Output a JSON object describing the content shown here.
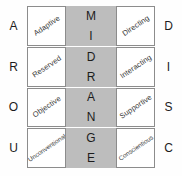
{
  "diagram": {
    "type": "personality-assessment-grid",
    "center_band": {
      "label": "MIDRANGE",
      "letters": [
        "M",
        "I",
        "D",
        "R",
        "A",
        "N",
        "G",
        "E"
      ],
      "color": "#bdbdbd"
    },
    "left_axis_letters": [
      "A",
      "R",
      "O",
      "U"
    ],
    "right_axis_letters": [
      "D",
      "I",
      "S",
      "C"
    ],
    "rows": [
      {
        "left_letter": "A",
        "left_trait": "Adaptive",
        "right_trait": "Directing",
        "right_letter": "D",
        "mid_letters": [
          "M",
          "I"
        ]
      },
      {
        "left_letter": "R",
        "left_trait": "Reserved",
        "right_trait": "Interacting",
        "right_letter": "I",
        "mid_letters": [
          "D",
          "R"
        ]
      },
      {
        "left_letter": "O",
        "left_trait": "Objective",
        "right_trait": "Supportive",
        "right_letter": "S",
        "mid_letters": [
          "A",
          "N"
        ]
      },
      {
        "left_letter": "U",
        "left_trait": "Unconventional",
        "right_trait": "Conscientious",
        "right_letter": "C",
        "mid_letters": [
          "G",
          "E"
        ]
      }
    ],
    "colors": {
      "midrange_fill": "#bdbdbd",
      "cell_fill": "#ffffff",
      "cell_border": "#8c8c8c",
      "text": "#3a3a3a",
      "letter_text": "#1c1c1c",
      "background": "#fefefe"
    }
  }
}
